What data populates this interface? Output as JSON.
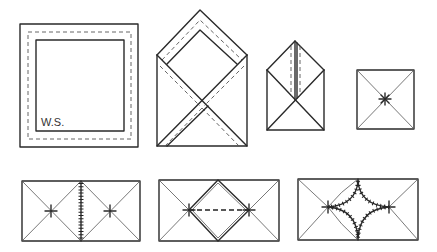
{
  "diagram": {
    "type": "folding-instructions",
    "steps_row1": [
      {
        "id": 1,
        "description": "Square sheet with inner dashed fold border",
        "label": "W.S."
      },
      {
        "id": 2,
        "description": "Corners folded to center forming envelope with dashed fold guides"
      },
      {
        "id": 3,
        "description": "Smaller envelope with vertical dashed fold at top flap"
      },
      {
        "id": 4,
        "description": "Square with diagonals meeting at star-marked center"
      }
    ],
    "steps_row2": [
      {
        "id": 5,
        "description": "Two squares joined by stitched seam, each with star-marked center"
      },
      {
        "id": 6,
        "description": "Joined squares with diamond fold and dashed line between star points"
      },
      {
        "id": 7,
        "description": "Joined squares with curved stitched four-point star shape"
      }
    ],
    "colors": {
      "line": "#2a2a2a",
      "background": "#ffffff"
    }
  }
}
